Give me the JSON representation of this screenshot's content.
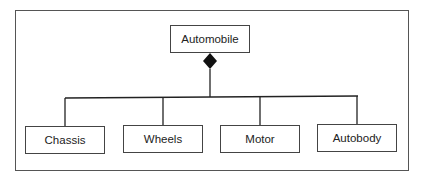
{
  "diagram": {
    "type": "UML composition",
    "parent": {
      "label": "Automobile"
    },
    "children": [
      {
        "label": "Chassis"
      },
      {
        "label": "Wheels"
      },
      {
        "label": "Motor"
      },
      {
        "label": "Autobody"
      }
    ],
    "relationship": "composition (filled diamond)",
    "colors": {
      "line": "#222222",
      "box_border": "#444444",
      "background": "#ffffff"
    }
  }
}
